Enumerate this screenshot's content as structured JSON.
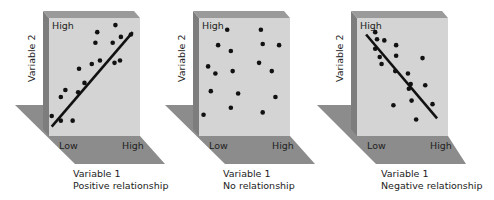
{
  "colors": {
    "face": "#d4d4d4",
    "side": "#8a8a8a",
    "top": "#9c9c9c",
    "floor": "#8c8c8c",
    "dot": "#111111",
    "line": "#111111",
    "text": "#222222"
  },
  "chart_data": [
    {
      "type": "scatter",
      "title": "Positive relationship",
      "xlabel": "Variable 1",
      "ylabel": "Variable 2",
      "x_ticks": [
        "Low",
        "High"
      ],
      "y_ticks": [
        "High"
      ],
      "trend": "positive",
      "points": [
        [
          0.03,
          0.17
        ],
        [
          0.13,
          0.13
        ],
        [
          0.26,
          0.13
        ],
        [
          0.13,
          0.33
        ],
        [
          0.18,
          0.39
        ],
        [
          0.32,
          0.37
        ],
        [
          0.39,
          0.45
        ],
        [
          0.33,
          0.57
        ],
        [
          0.47,
          0.61
        ],
        [
          0.56,
          0.64
        ],
        [
          0.51,
          0.79
        ],
        [
          0.53,
          0.88
        ],
        [
          0.72,
          0.62
        ],
        [
          0.78,
          0.64
        ],
        [
          0.7,
          0.79
        ],
        [
          0.79,
          0.84
        ],
        [
          0.73,
          0.94
        ],
        [
          0.9,
          0.86
        ]
      ],
      "trendline": [
        [
          0.03,
          0.08
        ],
        [
          0.92,
          0.88
        ]
      ]
    },
    {
      "type": "scatter",
      "title": "No relationship",
      "xlabel": "Variable 1",
      "ylabel": "Variable 2",
      "x_ticks": [
        "Low",
        "High"
      ],
      "y_ticks": [
        "High"
      ],
      "trend": "none",
      "points": [
        [
          0.05,
          0.18
        ],
        [
          0.13,
          0.38
        ],
        [
          0.1,
          0.59
        ],
        [
          0.18,
          0.53
        ],
        [
          0.21,
          0.77
        ],
        [
          0.31,
          0.9
        ],
        [
          0.35,
          0.72
        ],
        [
          0.37,
          0.55
        ],
        [
          0.43,
          0.36
        ],
        [
          0.35,
          0.24
        ],
        [
          0.66,
          0.62
        ],
        [
          0.8,
          0.55
        ],
        [
          0.7,
          0.78
        ],
        [
          0.68,
          0.9
        ],
        [
          0.84,
          0.33
        ],
        [
          0.7,
          0.2
        ],
        [
          0.88,
          0.77
        ]
      ]
    },
    {
      "type": "scatter",
      "title": "Negative relationship",
      "xlabel": "Variable 1",
      "ylabel": "Variable 2",
      "x_ticks": [
        "Low",
        "High"
      ],
      "y_ticks": [
        "High"
      ],
      "trend": "negative",
      "points": [
        [
          0.2,
          0.88
        ],
        [
          0.22,
          0.82
        ],
        [
          0.2,
          0.74
        ],
        [
          0.3,
          0.81
        ],
        [
          0.25,
          0.67
        ],
        [
          0.43,
          0.77
        ],
        [
          0.43,
          0.68
        ],
        [
          0.27,
          0.61
        ],
        [
          0.42,
          0.55
        ],
        [
          0.56,
          0.53
        ],
        [
          0.59,
          0.44
        ],
        [
          0.57,
          0.4
        ],
        [
          0.6,
          0.3
        ],
        [
          0.72,
          0.66
        ],
        [
          0.75,
          0.43
        ],
        [
          0.4,
          0.26
        ],
        [
          0.83,
          0.27
        ],
        [
          0.65,
          0.14
        ]
      ],
      "trendline": [
        [
          0.1,
          0.86
        ],
        [
          0.88,
          0.15
        ]
      ]
    }
  ],
  "panels": [
    {
      "y_axis_label": "Variable 2",
      "high_label": "High",
      "low_label": "Low",
      "x_high_label": "High",
      "x_axis_label": "Variable 1",
      "caption": "Positive relationship"
    },
    {
      "y_axis_label": "Variable 2",
      "high_label": "High",
      "low_label": "Low",
      "x_high_label": "High",
      "x_axis_label": "Variable 1",
      "caption": "No relationship"
    },
    {
      "y_axis_label": "Variable 2",
      "high_label": "High",
      "low_label": "Low",
      "x_high_label": "High",
      "x_axis_label": "Variable 1",
      "caption": "Negative relationship"
    }
  ]
}
